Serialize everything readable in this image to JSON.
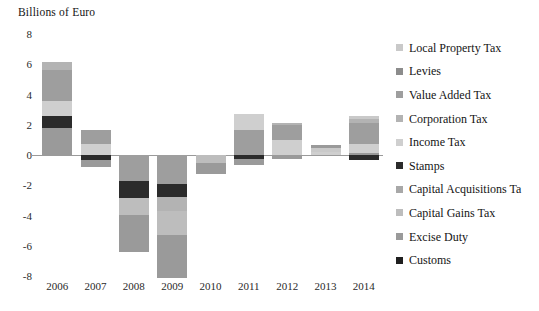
{
  "chart_data": {
    "type": "bar",
    "stacked": true,
    "title": "Billions of Euro",
    "xlabel": "",
    "ylabel": "Billions of Euro",
    "ylim": [
      -8,
      8
    ],
    "yticks": [
      8,
      6,
      4,
      2,
      0,
      -2,
      -4,
      -6,
      -8
    ],
    "grid": false,
    "legend_position": "right",
    "categories": [
      "2006",
      "2007",
      "2008",
      "2009",
      "2010",
      "2011",
      "2012",
      "2013",
      "2014"
    ],
    "series": [
      {
        "name": "Local Property Tax",
        "color": "#c9c9c9",
        "values": [
          0.0,
          0.0,
          0.0,
          0.0,
          0.0,
          0.0,
          0.0,
          0.25,
          0.15
        ]
      },
      {
        "name": "Levies",
        "color": "#8c8c8c",
        "values": [
          0.0,
          0.0,
          0.0,
          0.0,
          0.0,
          0.0,
          0.0,
          0.0,
          0.0
        ]
      },
      {
        "name": "Value Added Tax",
        "color": "#9e9e9e",
        "values": [
          2.05,
          0.9,
          -1.75,
          -1.9,
          0.0,
          1.65,
          1.0,
          0.0,
          1.35
        ]
      },
      {
        "name": "Corporation Tax",
        "color": "#b3b3b3",
        "values": [
          0.55,
          0.0,
          0.0,
          -0.95,
          0.0,
          0.0,
          0.1,
          0.0,
          0.3
        ]
      },
      {
        "name": "Income Tax",
        "color": "#cfcfcf",
        "values": [
          0.95,
          0.75,
          0.0,
          0.0,
          0.0,
          0.0,
          1.0,
          0.2,
          0.6
        ]
      },
      {
        "name": "Stamps",
        "color": "#2b2b2b",
        "values": [
          0.8,
          -0.35,
          -1.1,
          -0.85,
          0.0,
          -0.25,
          0.0,
          0.0,
          -0.35
        ]
      },
      {
        "name": "Capital Acquisitions Tax",
        "color": "#a8a8a8",
        "values": [
          0.0,
          0.0,
          0.0,
          0.0,
          0.0,
          0.0,
          0.0,
          0.0,
          0.0
        ]
      },
      {
        "name": "Capital Gains Tax",
        "color": "#bdbdbd",
        "values": [
          0.0,
          0.0,
          -1.1,
          -1.6,
          -0.55,
          0.0,
          0.0,
          0.0,
          0.0
        ]
      },
      {
        "name": "Excise Duty",
        "color": "#9a9a9a",
        "values": [
          1.8,
          -0.45,
          -2.45,
          -2.85,
          -0.7,
          -0.4,
          -0.25,
          0.2,
          0.15
        ]
      },
      {
        "name": "Customs",
        "color": "#1f1f1f",
        "values": [
          0.0,
          0.0,
          0.0,
          0.0,
          0.0,
          0.0,
          0.0,
          0.0,
          0.0
        ]
      }
    ],
    "bars": [
      {
        "year": "2006",
        "positive": [
          {
            "series": "Excise Duty",
            "color": "#9a9a9a",
            "value": 1.8
          },
          {
            "series": "Stamps",
            "color": "#2b2b2b",
            "value": 0.8
          },
          {
            "series": "Income Tax",
            "color": "#cfcfcf",
            "value": 0.95
          },
          {
            "series": "Value Added Tax",
            "color": "#9e9e9e",
            "value": 2.05
          },
          {
            "series": "Corporation Tax",
            "color": "#b3b3b3",
            "value": 0.55
          }
        ],
        "negative": [],
        "total": 6.15
      },
      {
        "year": "2007",
        "positive": [
          {
            "series": "Income Tax",
            "color": "#cfcfcf",
            "value": 0.75
          },
          {
            "series": "Value Added Tax",
            "color": "#9e9e9e",
            "value": 0.9
          }
        ],
        "negative": [
          {
            "series": "Stamps",
            "color": "#2b2b2b",
            "value": -0.35
          },
          {
            "series": "Excise Duty",
            "color": "#9a9a9a",
            "value": -0.45
          }
        ],
        "total": 0.85
      },
      {
        "year": "2008",
        "positive": [],
        "negative": [
          {
            "series": "Value Added Tax",
            "color": "#9e9e9e",
            "value": -1.75
          },
          {
            "series": "Stamps",
            "color": "#2b2b2b",
            "value": -1.1
          },
          {
            "series": "Capital Gains Tax",
            "color": "#bdbdbd",
            "value": -1.1
          },
          {
            "series": "Excise Duty",
            "color": "#9a9a9a",
            "value": -2.45
          }
        ],
        "total": -6.4
      },
      {
        "year": "2009",
        "positive": [],
        "negative": [
          {
            "series": "Value Added Tax",
            "color": "#9e9e9e",
            "value": -1.9
          },
          {
            "series": "Stamps",
            "color": "#2b2b2b",
            "value": -0.85
          },
          {
            "series": "Corporation Tax",
            "color": "#b3b3b3",
            "value": -0.95
          },
          {
            "series": "Capital Gains Tax",
            "color": "#bdbdbd",
            "value": -1.6
          },
          {
            "series": "Excise Duty",
            "color": "#9a9a9a",
            "value": -2.85
          }
        ],
        "total": -8.15
      },
      {
        "year": "2010",
        "positive": [],
        "negative": [
          {
            "series": "Capital Gains Tax",
            "color": "#bdbdbd",
            "value": -0.55
          },
          {
            "series": "Excise Duty",
            "color": "#9a9a9a",
            "value": -0.7
          }
        ],
        "total": -1.25
      },
      {
        "year": "2011",
        "positive": [
          {
            "series": "Value Added Tax",
            "color": "#9e9e9e",
            "value": 1.65
          },
          {
            "series": "Income Tax",
            "color": "#cfcfcf",
            "value": 1.05
          }
        ],
        "negative": [
          {
            "series": "Stamps",
            "color": "#2b2b2b",
            "value": -0.25
          },
          {
            "series": "Excise Duty",
            "color": "#9a9a9a",
            "value": -0.4
          }
        ],
        "total": 2.05
      },
      {
        "year": "2012",
        "positive": [
          {
            "series": "Income Tax",
            "color": "#cfcfcf",
            "value": 1.0
          },
          {
            "series": "Value Added Tax",
            "color": "#9e9e9e",
            "value": 1.0
          },
          {
            "series": "Corporation Tax",
            "color": "#b3b3b3",
            "value": 0.1
          }
        ],
        "negative": [
          {
            "series": "Excise Duty",
            "color": "#9a9a9a",
            "value": -0.25
          }
        ],
        "total": 1.85
      },
      {
        "year": "2013",
        "positive": [
          {
            "series": "Income Tax",
            "color": "#cfcfcf",
            "value": 0.2
          },
          {
            "series": "Local Property Tax",
            "color": "#c9c9c9",
            "value": 0.25
          },
          {
            "series": "Excise Duty",
            "color": "#9a9a9a",
            "value": 0.2
          }
        ],
        "negative": [],
        "total": 0.65
      },
      {
        "year": "2014",
        "positive": [
          {
            "series": "Excise Duty",
            "color": "#9a9a9a",
            "value": 0.15
          },
          {
            "series": "Stamps",
            "color": "#2b2b2b",
            "value": -0.35
          },
          {
            "series": "Income Tax",
            "color": "#cfcfcf",
            "value": 0.6
          },
          {
            "series": "Value Added Tax",
            "color": "#9e9e9e",
            "value": 1.35
          },
          {
            "series": "Corporation Tax",
            "color": "#b3b3b3",
            "value": 0.3
          },
          {
            "series": "Local Property Tax",
            "color": "#c9c9c9",
            "value": 0.15
          }
        ],
        "negative": [],
        "total": 2.55
      }
    ]
  },
  "legend": {
    "items": [
      {
        "label": "Local Property Tax",
        "color": "#c9c9c9"
      },
      {
        "label": "Levies",
        "color": "#8c8c8c"
      },
      {
        "label": "Value Added Tax",
        "color": "#9e9e9e"
      },
      {
        "label": "Corporation Tax",
        "color": "#b3b3b3"
      },
      {
        "label": "Income Tax",
        "color": "#cfcfcf"
      },
      {
        "label": "Stamps",
        "color": "#2b2b2b"
      },
      {
        "label": "Capital Acquisitions Ta",
        "color": "#a8a8a8"
      },
      {
        "label": "Capital Gains Tax",
        "color": "#bdbdbd"
      },
      {
        "label": "Excise Duty",
        "color": "#9a9a9a"
      },
      {
        "label": "Customs",
        "color": "#1f1f1f"
      }
    ]
  },
  "axis": {
    "title": "Billions of Euro",
    "zero_line_color": "#9a9a9a"
  }
}
